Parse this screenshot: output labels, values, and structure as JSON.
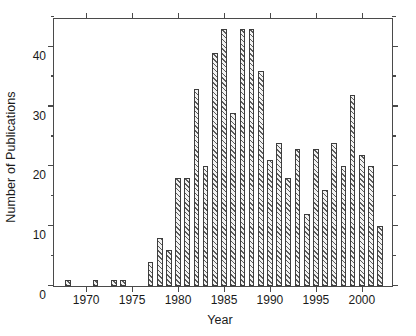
{
  "chart_data": {
    "type": "bar",
    "title": "",
    "xlabel": "Year",
    "ylabel": "Number of Publications",
    "categories": [
      1968,
      1971,
      1973,
      1974,
      1977,
      1978,
      1979,
      1980,
      1981,
      1982,
      1983,
      1984,
      1985,
      1986,
      1987,
      1988,
      1989,
      1990,
      1991,
      1992,
      1993,
      1994,
      1995,
      1996,
      1997,
      1998,
      1999,
      2000,
      2001,
      2002
    ],
    "values": [
      1,
      1,
      1,
      1,
      4,
      8,
      6,
      18,
      18,
      33,
      20,
      39,
      43,
      29,
      43,
      43,
      36,
      21,
      24,
      18,
      23,
      12,
      23,
      16,
      24,
      20,
      32,
      22,
      20,
      10
    ],
    "xlim": [
      1966.5,
      2003.5
    ],
    "ylim": [
      0,
      45
    ],
    "xticks": [
      1970,
      1975,
      1980,
      1985,
      1990,
      1995,
      2000
    ],
    "xtick_labels": [
      "1970",
      "1975",
      "1980",
      "1985",
      "1990",
      "1995",
      "2000"
    ],
    "yticks": [
      0,
      10,
      20,
      30,
      40
    ],
    "ytick_labels": [
      "0",
      "10",
      "20",
      "30",
      "40"
    ],
    "yticks_minor": [
      5,
      15,
      25,
      35,
      45
    ],
    "grid": false,
    "legend": null,
    "bar_fill": "#f2f2f2",
    "bar_hatch": "diagonal-lines",
    "bar_edge_color": "#3d3d3d",
    "axis_color": "#4a4a4a",
    "background": "#ffffff"
  }
}
